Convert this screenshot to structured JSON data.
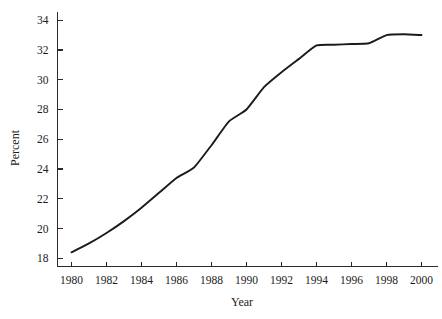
{
  "chart_data": {
    "type": "line",
    "title": "",
    "xlabel": "Year",
    "ylabel": "Percent",
    "xlim": [
      1979.2,
      2000.6
    ],
    "ylim": [
      17.45,
      34.55
    ],
    "grid": false,
    "legend": null,
    "line_color": "#1d1a1c",
    "x": [
      1980,
      1981,
      1982,
      1983,
      1984,
      1985,
      1986,
      1987,
      1988,
      1989,
      1990,
      1991,
      1992,
      1993,
      1994,
      1995,
      1996,
      1997,
      1998,
      1999,
      2000
    ],
    "values": [
      18.4,
      19.0,
      19.7,
      20.5,
      21.4,
      22.4,
      23.4,
      24.1,
      25.6,
      27.2,
      28.0,
      29.5,
      30.5,
      31.4,
      32.3,
      32.35,
      32.4,
      32.45,
      33.0,
      33.05,
      33.0
    ],
    "series": [
      {
        "name": "Percent",
        "values": [
          18.4,
          19.0,
          19.7,
          20.5,
          21.4,
          22.4,
          23.4,
          24.1,
          25.6,
          27.2,
          28.0,
          29.5,
          30.5,
          31.4,
          32.3,
          32.35,
          32.4,
          32.45,
          33.0,
          33.05,
          33.0
        ]
      }
    ],
    "x_ticks": [
      1980,
      1982,
      1984,
      1986,
      1988,
      1990,
      1992,
      1994,
      1996,
      1998,
      2000
    ],
    "x_tick_labels": [
      "1980",
      "1982",
      "1984",
      "1986",
      "1988",
      "1990",
      "1992",
      "1994",
      "1996",
      "1998",
      "2000"
    ],
    "y_ticks": [
      18,
      20,
      22,
      24,
      26,
      28,
      30,
      32,
      34
    ],
    "y_tick_labels": [
      "18",
      "20",
      "22",
      "24",
      "26",
      "28",
      "30",
      "32",
      "34"
    ]
  },
  "axes": {
    "y_title": "Percent",
    "x_title": "Year"
  }
}
